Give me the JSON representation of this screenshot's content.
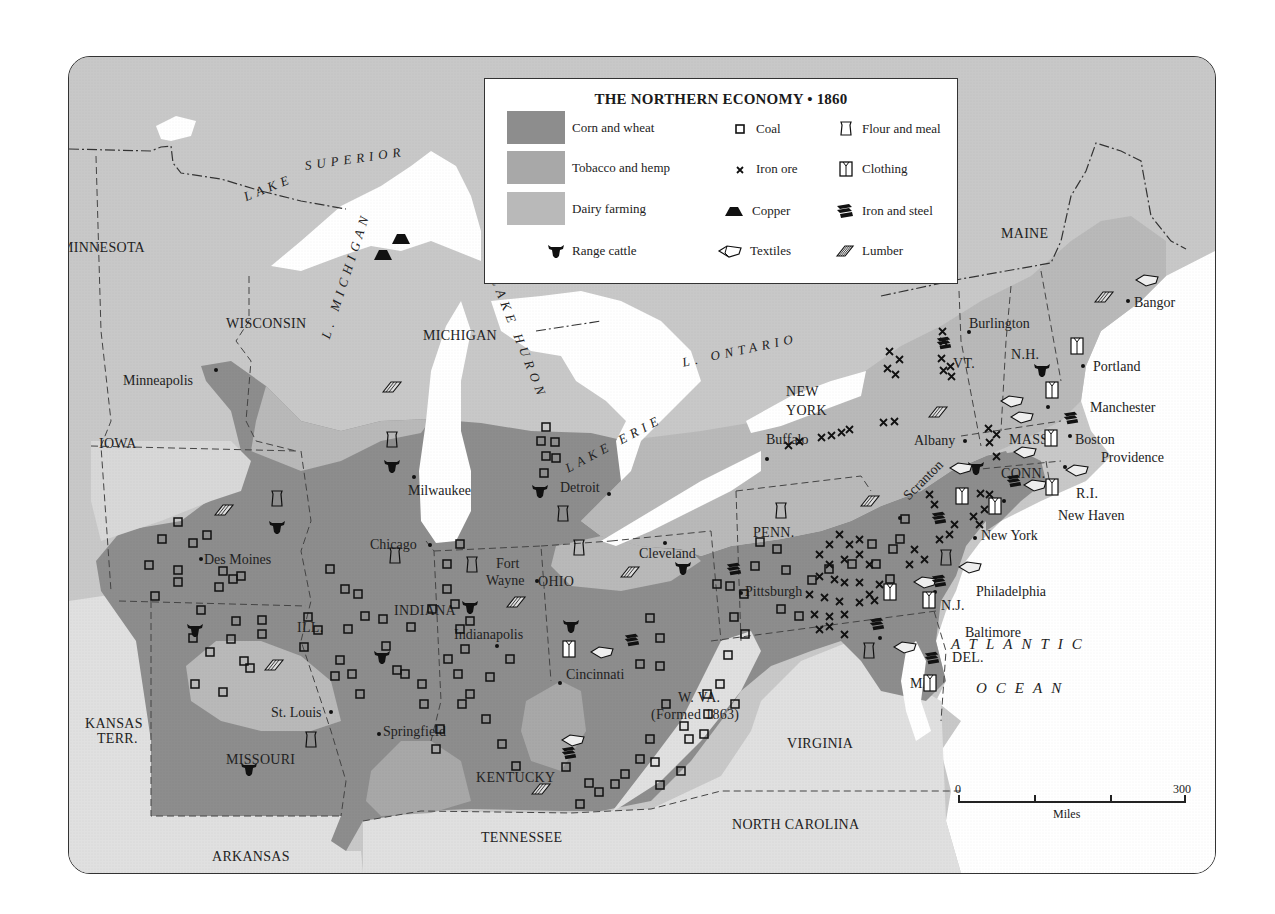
{
  "title": "THE NORTHERN ECONOMY • 1860",
  "colors": {
    "canada_and_north_unshaded": "#c8c8c8",
    "south": "#e0e0e0",
    "corn_and_wheat": "#8d8d8d",
    "tobacco_and_hemp": "#a8a8a8",
    "dairy_farming": "#b9b9b9",
    "water": "#ffffff",
    "symbols": "#1a1a1a"
  },
  "legend": {
    "areas": [
      {
        "label": "Corn and wheat",
        "color": "#8d8d8d"
      },
      {
        "label": "Tobacco and hemp",
        "color": "#a8a8a8"
      },
      {
        "label": "Dairy farming",
        "color": "#b9b9b9"
      }
    ],
    "range_cattle": {
      "label": "Range cattle",
      "icon": "cattle-icon"
    },
    "symbols": [
      {
        "label": "Coal",
        "icon": "coal-square-icon"
      },
      {
        "label": "Iron ore",
        "icon": "iron-ore-x-icon"
      },
      {
        "label": "Copper",
        "icon": "copper-trapezoid-icon"
      },
      {
        "label": "Textiles",
        "icon": "textiles-bolt-icon"
      },
      {
        "label": "Flour and meal",
        "icon": "flour-sack-icon"
      },
      {
        "label": "Clothing",
        "icon": "clothing-shirt-icon"
      },
      {
        "label": "Iron and steel",
        "icon": "iron-steel-icon"
      },
      {
        "label": "Lumber",
        "icon": "lumber-boards-icon"
      }
    ]
  },
  "labels": {
    "countries": [
      {
        "text": "CANADA",
        "x": 668,
        "y": 248
      }
    ],
    "oceans": [
      {
        "text": "ATLANTIC",
        "x": 950,
        "y": 636
      },
      {
        "text": "OCEAN",
        "x": 975,
        "y": 680
      }
    ],
    "lakes": [
      {
        "text": "LAKE",
        "x": 241,
        "y": 190,
        "rot": -22
      },
      {
        "text": "SUPERIOR",
        "x": 303,
        "y": 158,
        "rot": -8
      },
      {
        "text": "L. MICHIGAN",
        "x": 318,
        "y": 335,
        "rot": -72
      },
      {
        "text": "LAKE HURON",
        "x": 500,
        "y": 275,
        "rot": 68
      },
      {
        "text": "L. ONTARIO",
        "x": 680,
        "y": 355,
        "rot": -12
      },
      {
        "text": "LAKE ERIE",
        "x": 562,
        "y": 462,
        "rot": -28
      }
    ],
    "states": [
      {
        "text": "MINNESOTA",
        "x": 60,
        "y": 240
      },
      {
        "text": "WISCONSIN",
        "x": 225,
        "y": 316
      },
      {
        "text": "MICHIGAN",
        "x": 422,
        "y": 328
      },
      {
        "text": "IOWA",
        "x": 98,
        "y": 436
      },
      {
        "text": "ILL.",
        "x": 296,
        "y": 620
      },
      {
        "text": "INDIANA",
        "x": 393,
        "y": 603
      },
      {
        "text": "OHIO",
        "x": 537,
        "y": 574
      },
      {
        "text": "PENN.",
        "x": 752,
        "y": 525
      },
      {
        "text": "NEW",
        "x": 785,
        "y": 384
      },
      {
        "text": "YORK",
        "x": 785,
        "y": 403
      },
      {
        "text": "VT.",
        "x": 952,
        "y": 356
      },
      {
        "text": "N.H.",
        "x": 1010,
        "y": 347
      },
      {
        "text": "MAINE",
        "x": 1000,
        "y": 226
      },
      {
        "text": "MASS.",
        "x": 1008,
        "y": 432
      },
      {
        "text": "CONN.",
        "x": 1000,
        "y": 466
      },
      {
        "text": "R.I.",
        "x": 1075,
        "y": 486
      },
      {
        "text": "N.J.",
        "x": 940,
        "y": 598
      },
      {
        "text": "DEL.",
        "x": 951,
        "y": 650
      },
      {
        "text": "MD.",
        "x": 909,
        "y": 676
      },
      {
        "text": "KANSAS",
        "x": 84,
        "y": 716
      },
      {
        "text": "TERR.",
        "x": 96,
        "y": 731
      },
      {
        "text": "MISSOURI",
        "x": 225,
        "y": 752
      },
      {
        "text": "KENTUCKY",
        "x": 475,
        "y": 770
      },
      {
        "text": "W. VA.",
        "x": 677,
        "y": 690
      },
      {
        "text": "(Formed 1863)",
        "x": 650,
        "y": 707
      },
      {
        "text": "VIRGINIA",
        "x": 786,
        "y": 736
      },
      {
        "text": "NORTH CAROLINA",
        "x": 731,
        "y": 817
      },
      {
        "text": "TENNESSEE",
        "x": 480,
        "y": 830
      },
      {
        "text": "ARKANSAS",
        "x": 211,
        "y": 849
      }
    ],
    "cities": [
      {
        "text": "Minneapolis",
        "x": 122,
        "y": 373,
        "dot": [
          215,
          369
        ],
        "align": "left"
      },
      {
        "text": "Milwaukee",
        "x": 407,
        "y": 483,
        "dot": [
          413,
          476
        ]
      },
      {
        "text": "Detroit",
        "x": 559,
        "y": 480,
        "dot": [
          608,
          493
        ],
        "align": "left"
      },
      {
        "text": "Chicago",
        "x": 369,
        "y": 537,
        "dot": [
          429,
          544
        ],
        "align": "left"
      },
      {
        "text": "Des Moines",
        "x": 203,
        "y": 552,
        "dot": [
          200,
          558
        ]
      },
      {
        "text": "Fort",
        "x": 495,
        "y": 556
      },
      {
        "text": "Wayne",
        "x": 485,
        "y": 573,
        "dot": [
          536,
          580
        ]
      },
      {
        "text": "Indianapolis",
        "x": 453,
        "y": 627,
        "dot": [
          496,
          645
        ]
      },
      {
        "text": "Cleveland",
        "x": 638,
        "y": 546,
        "dot": [
          664,
          542
        ]
      },
      {
        "text": "Cincinnati",
        "x": 565,
        "y": 667,
        "dot": [
          559,
          682
        ]
      },
      {
        "text": "St. Louis",
        "x": 270,
        "y": 705,
        "dot": [
          330,
          711
        ]
      },
      {
        "text": "Springfield",
        "x": 382,
        "y": 724,
        "dot": [
          378,
          733
        ]
      },
      {
        "text": "Pittsburgh",
        "x": 744,
        "y": 584,
        "dot": [
          740,
          592
        ]
      },
      {
        "text": "Buffalo",
        "x": 765,
        "y": 432,
        "dot": [
          766,
          458
        ]
      },
      {
        "text": "Albany",
        "x": 913,
        "y": 433,
        "dot": [
          964,
          440
        ],
        "align": "left"
      },
      {
        "text": "Scranton",
        "x": 900,
        "y": 492,
        "rot": -45,
        "dot": [
          899,
          517
        ]
      },
      {
        "text": "Burlington",
        "x": 968,
        "y": 316,
        "dot": [
          968,
          331
        ]
      },
      {
        "text": "Bangor",
        "x": 1133,
        "y": 295,
        "dot": [
          1127,
          300
        ]
      },
      {
        "text": "Portland",
        "x": 1092,
        "y": 359,
        "dot": [
          1082,
          365
        ]
      },
      {
        "text": "Manchester",
        "x": 1089,
        "y": 400,
        "dot": [
          1047,
          406
        ]
      },
      {
        "text": "Boston",
        "x": 1074,
        "y": 432,
        "dot": [
          1069,
          435
        ]
      },
      {
        "text": "Providence",
        "x": 1100,
        "y": 450,
        "dot": [
          1064,
          466
        ]
      },
      {
        "text": "New Haven",
        "x": 1057,
        "y": 508,
        "dot": [
          1003,
          500
        ]
      },
      {
        "text": "New York",
        "x": 980,
        "y": 528,
        "dot": [
          974,
          537
        ]
      },
      {
        "text": "Philadelphia",
        "x": 975,
        "y": 584,
        "dot": [
          934,
          591
        ]
      },
      {
        "text": "Baltimore",
        "x": 964,
        "y": 625,
        "dot": [
          879,
          637
        ]
      }
    ]
  },
  "scale_bar": {
    "min_label": "0",
    "max_label": "300",
    "unit": "Miles"
  }
}
